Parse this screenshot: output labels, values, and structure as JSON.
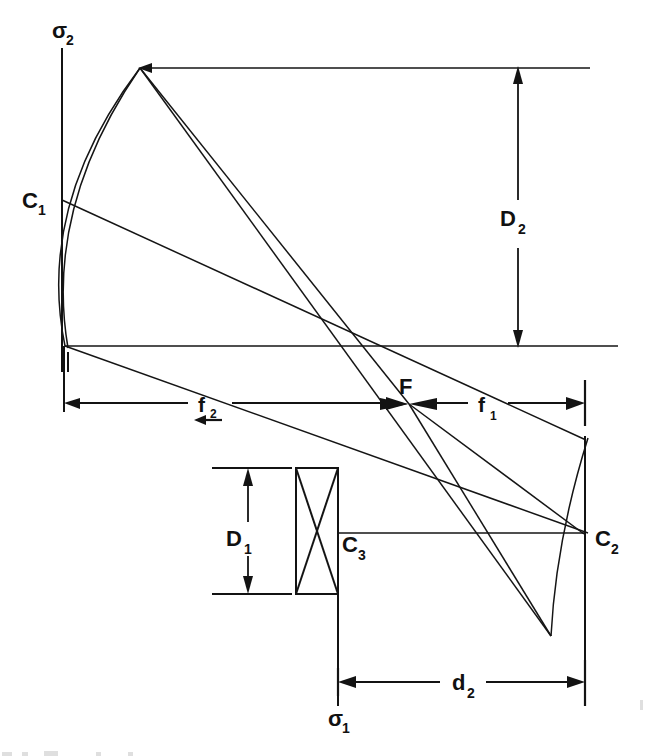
{
  "figure": {
    "kind": "optical-ray-diagram",
    "background_color": "#ffffff",
    "ink_color": "#131313",
    "width": 652,
    "height": 756
  },
  "labels": {
    "sigma2": {
      "base": "σ",
      "sub": "2",
      "x": 52,
      "y": 38
    },
    "sigma1": {
      "base": "σ",
      "sub": "1",
      "x": 329,
      "y": 723
    },
    "c1": {
      "base": "C",
      "sub": "1",
      "x": 24,
      "y": 208
    },
    "c2": {
      "base": "C",
      "sub": "2",
      "x": 597,
      "y": 545
    },
    "c3": {
      "base": "C",
      "sub": "3",
      "x": 341,
      "y": 551
    },
    "f_point": {
      "base": "F",
      "x": 399,
      "y": 394
    },
    "d2_upper": {
      "base": "D",
      "sub": "2",
      "x": 502,
      "y": 224
    },
    "d1_lower": {
      "base": "D",
      "sub": "1",
      "x": 228,
      "y": 545
    },
    "f2_left": {
      "base": "f",
      "sub": "2",
      "x": 200,
      "y": 411
    },
    "f1_right": {
      "base": "f",
      "sub": "1",
      "x": 480,
      "y": 411
    },
    "d2_bottom": {
      "base": "d",
      "sub": "2",
      "x": 455,
      "y": 684
    }
  },
  "dimensions": {
    "D2": {
      "name": "D2",
      "orientation": "vertical",
      "from_y": 68,
      "to_y": 346,
      "x": 518
    },
    "D1": {
      "name": "D1",
      "orientation": "vertical",
      "from_y": 468,
      "to_y": 594,
      "x": 248
    },
    "f2": {
      "name": "f2",
      "orientation": "horizontal",
      "from_x": 64,
      "to_x": 400,
      "y": 403
    },
    "f1": {
      "name": "f1",
      "orientation": "horizontal",
      "from_x": 416,
      "to_x": 585,
      "y": 403
    },
    "d2": {
      "name": "d2",
      "orientation": "horizontal",
      "from_x": 338,
      "to_x": 585,
      "y": 682
    }
  },
  "elements": {
    "optical_axis": {
      "name": "optical-axis",
      "x1": 65,
      "y1": 346,
      "x2": 618,
      "y2": 346
    },
    "sigma2_axis": {
      "name": "sigma2-vertical-axis",
      "x1": 62,
      "y1": 48,
      "x2": 62,
      "y2": 372
    },
    "sigma1_axis": {
      "name": "sigma1-vertical-axis",
      "x1": 338,
      "y1": 594,
      "x2": 338,
      "y2": 706
    },
    "c2_vertical": {
      "name": "c2-vertical-reference",
      "x1": 585,
      "y1": 436,
      "x2": 585,
      "y2": 706
    },
    "mirror_c1": {
      "name": "primary-mirror-c1",
      "top_x": 140,
      "top_y": 68,
      "vertex_x": 65,
      "vertex_y": 346
    },
    "mirror_c2": {
      "name": "secondary-mirror-c2",
      "top_x": 588,
      "top_y": 438,
      "bottom_x": 578,
      "bottom_y": 636
    },
    "coil_c3": {
      "name": "coil-c3",
      "x": 296,
      "y": 468,
      "width": 42,
      "height": 126
    },
    "incoming_ray": {
      "name": "incoming-parallel-ray",
      "from_x": 590,
      "to_x": 140,
      "y": 68
    },
    "c3_c2_link": {
      "name": "c3-to-c2-connector",
      "x1": 338,
      "y1": 533,
      "x2": 585,
      "y2": 533
    }
  },
  "rays": [
    {
      "name": "ray-c1-top-to-f",
      "points": "140,68 408,404"
    },
    {
      "name": "ray-c1-vertex-to-f",
      "points": "62,200 586,440"
    },
    {
      "name": "ray-axis-to-c2",
      "points": "65,346 588,533"
    },
    {
      "name": "ray-f-to-c2-upper",
      "points": "408,404 586,438"
    },
    {
      "name": "ray-f-to-c2-mid",
      "points": "408,404 584,533"
    },
    {
      "name": "ray-f-to-c2-low",
      "points": "408,404 551,636"
    },
    {
      "name": "ray-c1-top-through-f",
      "points": "140,68 551,636"
    }
  ]
}
